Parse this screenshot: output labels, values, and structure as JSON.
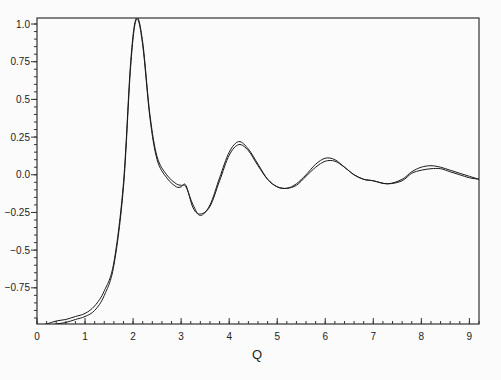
{
  "chart_data": {
    "type": "line",
    "title": "",
    "xlabel": "Q",
    "ylabel": "",
    "xlim": [
      0,
      9.2
    ],
    "ylim": [
      -0.99,
      1.04
    ],
    "grid": false,
    "legend": null,
    "x_ticks": [
      0,
      1,
      2,
      3,
      4,
      5,
      6,
      7,
      8,
      9
    ],
    "x_tick_labels": [
      "0",
      "1",
      "2",
      "3",
      "4",
      "5",
      "6",
      "7",
      "8",
      "9"
    ],
    "y_ticks": [
      1.0,
      0.75,
      0.5,
      0.25,
      0.0,
      -0.25,
      -0.5,
      -0.75
    ],
    "y_tick_labels": [
      "1.0",
      "0.75",
      "0.5",
      "0.25",
      "0.0",
      "−0.25",
      "−0.5",
      "−0.75"
    ],
    "series": [
      {
        "name": "curve-1",
        "x": [
          0.0,
          0.2,
          0.4,
          0.6,
          0.8,
          1.0,
          1.2,
          1.4,
          1.6,
          1.8,
          1.95,
          2.07,
          2.2,
          2.35,
          2.5,
          2.7,
          2.9,
          3.0,
          3.1,
          3.25,
          3.4,
          3.6,
          3.8,
          4.0,
          4.2,
          4.4,
          4.6,
          4.8,
          5.0,
          5.2,
          5.4,
          5.6,
          5.8,
          6.0,
          6.2,
          6.4,
          6.6,
          6.8,
          7.0,
          7.3,
          7.6,
          7.8,
          8.0,
          8.2,
          8.4,
          8.6,
          8.8,
          9.0,
          9.2
        ],
        "y": [
          -1.0,
          -0.99,
          -0.97,
          -0.96,
          -0.94,
          -0.92,
          -0.87,
          -0.77,
          -0.58,
          -0.05,
          0.75,
          1.04,
          0.88,
          0.4,
          0.12,
          0.0,
          -0.06,
          -0.07,
          -0.08,
          -0.2,
          -0.27,
          -0.2,
          -0.02,
          0.15,
          0.22,
          0.17,
          0.07,
          -0.03,
          -0.08,
          -0.09,
          -0.06,
          0.0,
          0.07,
          0.11,
          0.1,
          0.05,
          0.0,
          -0.03,
          -0.04,
          -0.06,
          -0.03,
          0.02,
          0.05,
          0.06,
          0.05,
          0.03,
          0.01,
          -0.01,
          -0.03
        ]
      },
      {
        "name": "curve-2",
        "x": [
          0.0,
          0.2,
          0.4,
          0.6,
          0.8,
          1.0,
          1.2,
          1.4,
          1.6,
          1.8,
          1.95,
          2.07,
          2.2,
          2.35,
          2.5,
          2.7,
          2.9,
          3.0,
          3.1,
          3.25,
          3.4,
          3.6,
          3.8,
          4.0,
          4.2,
          4.4,
          4.6,
          4.8,
          5.0,
          5.2,
          5.4,
          5.6,
          5.8,
          6.0,
          6.2,
          6.4,
          6.6,
          6.8,
          7.0,
          7.3,
          7.6,
          7.8,
          8.0,
          8.2,
          8.4,
          8.6,
          8.8,
          9.0,
          9.2
        ],
        "y": [
          -1.0,
          -1.0,
          -0.99,
          -0.98,
          -0.96,
          -0.94,
          -0.9,
          -0.8,
          -0.6,
          -0.08,
          0.72,
          1.03,
          0.86,
          0.38,
          0.1,
          -0.02,
          -0.08,
          -0.08,
          -0.07,
          -0.22,
          -0.26,
          -0.21,
          -0.04,
          0.13,
          0.2,
          0.16,
          0.06,
          -0.03,
          -0.08,
          -0.09,
          -0.07,
          -0.01,
          0.05,
          0.09,
          0.09,
          0.05,
          0.0,
          -0.03,
          -0.04,
          -0.06,
          -0.04,
          0.01,
          0.03,
          0.04,
          0.04,
          0.02,
          0.0,
          -0.02,
          -0.03
        ]
      }
    ]
  },
  "plot": {
    "x_axis_label": "Q",
    "colors": {
      "line": "#1a1a1a",
      "frame": "#333333",
      "background": "#fbfbfb"
    }
  }
}
